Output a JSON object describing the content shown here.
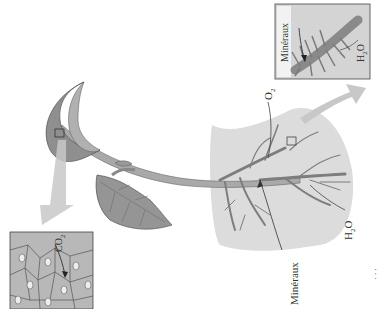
{
  "diagram": {
    "labels": {
      "co2": "CO",
      "co2_sub": "2",
      "o2": "O",
      "o2_sub": "2",
      "h2o_root": "H",
      "h2o_root_sub": "2",
      "h2o_root_o": "O",
      "h2o_inset": "H",
      "h2o_inset_sub": "2",
      "h2o_inset_o": "O",
      "mineraux_root": "Minéraux",
      "mineraux_inset": "Minéraux"
    },
    "insets": [
      {
        "name": "leaf-stomata-inset",
        "shows": "leaf epidermis with stomata"
      },
      {
        "name": "root-hair-inset",
        "shows": "root hairs absorbing minerals and water"
      }
    ],
    "colors": {
      "plant_fill": "#a9a9a9",
      "plant_dark": "#8a8a8a",
      "soil": "#dcdcdc",
      "arrow": "#c8c8c8",
      "outline": "#555555",
      "inset_bg": "#b8b8b8"
    },
    "margin_marks": "· · ·"
  }
}
